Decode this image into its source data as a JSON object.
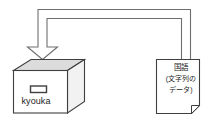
{
  "diagram": {
    "title": "",
    "background_color": "#ffffff",
    "stroke_color": "#6e6e6e",
    "outline_color": "#3f3f3f",
    "box_interior_color": "#dcdcdc",
    "arrow": {
      "name": "assignment-arrow",
      "direction": "right-to-left-down",
      "style": "outlined-u-shape",
      "points_to": "box"
    },
    "box": {
      "label": "kyouka",
      "shape": "open-top-carton",
      "handle": "handle-slot"
    },
    "document": {
      "title": "国語",
      "subtitle_line1": "(文字列の",
      "subtitle_line2": "データ)",
      "shape": "page-with-folded-corner"
    }
  }
}
